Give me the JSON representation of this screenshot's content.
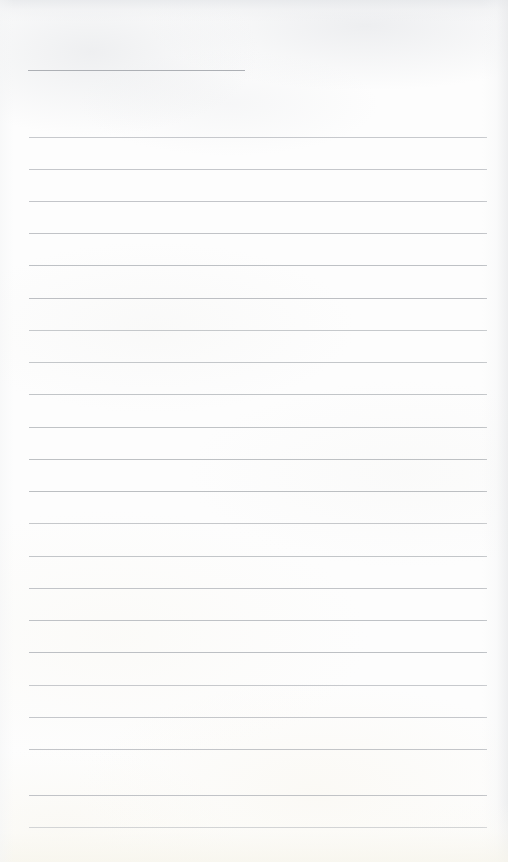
{
  "document": {
    "kind": "scanned-lined-page",
    "title": "",
    "content_text": "",
    "page_width": 508,
    "page_height": 862,
    "paper_color": "#fdfdfd",
    "rule_color": "#b9bcc0",
    "header_rule_color": "#a9acb1",
    "edge_shadow_color": "#e4e6e9",
    "bottom_tint_color": "#f7f5ec"
  },
  "header_rule": {
    "name": "title-underline",
    "x": 28,
    "y": 70,
    "width": 217,
    "text": ""
  },
  "rules": [
    {
      "y": 137,
      "x": 29,
      "width": 458,
      "text": ""
    },
    {
      "y": 169,
      "x": 29,
      "width": 458,
      "text": ""
    },
    {
      "y": 201,
      "x": 29,
      "width": 458,
      "text": ""
    },
    {
      "y": 233,
      "x": 29,
      "width": 458,
      "text": ""
    },
    {
      "y": 265,
      "x": 29,
      "width": 458,
      "text": ""
    },
    {
      "y": 298,
      "x": 29,
      "width": 458,
      "text": ""
    },
    {
      "y": 330,
      "x": 29,
      "width": 458,
      "text": ""
    },
    {
      "y": 362,
      "x": 29,
      "width": 458,
      "text": ""
    },
    {
      "y": 394,
      "x": 29,
      "width": 458,
      "text": ""
    },
    {
      "y": 427,
      "x": 29,
      "width": 458,
      "text": ""
    },
    {
      "y": 459,
      "x": 29,
      "width": 458,
      "text": ""
    },
    {
      "y": 491,
      "x": 29,
      "width": 458,
      "text": ""
    },
    {
      "y": 523,
      "x": 29,
      "width": 458,
      "text": ""
    },
    {
      "y": 556,
      "x": 29,
      "width": 458,
      "text": ""
    },
    {
      "y": 588,
      "x": 29,
      "width": 458,
      "text": ""
    },
    {
      "y": 620,
      "x": 29,
      "width": 458,
      "text": ""
    },
    {
      "y": 652,
      "x": 29,
      "width": 458,
      "text": ""
    },
    {
      "y": 685,
      "x": 29,
      "width": 458,
      "text": ""
    },
    {
      "y": 717,
      "x": 29,
      "width": 458,
      "text": ""
    },
    {
      "y": 749,
      "x": 29,
      "width": 458,
      "text": ""
    },
    {
      "y": 795,
      "x": 29,
      "width": 458,
      "text": ""
    },
    {
      "y": 827,
      "x": 29,
      "width": 458,
      "text": ""
    }
  ]
}
